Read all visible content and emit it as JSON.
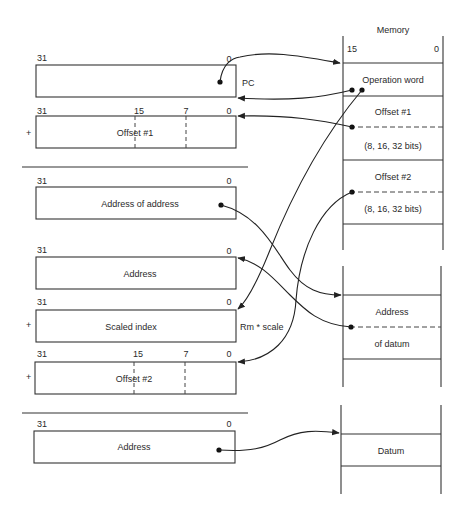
{
  "memory": {
    "title": "Memory",
    "bit_high": "15",
    "bit_low": "0",
    "cells": {
      "operation_word": "Operation word",
      "offset1": "Offset #1",
      "offset1_size": "(8, 16, 32 bits)",
      "offset2": "Offset #2",
      "offset2_size": "(8, 16, 32 bits)",
      "address_of_datum_1": "Address",
      "address_of_datum_2": "of datum",
      "datum": "Datum"
    }
  },
  "registers": {
    "pc": {
      "bit_high": "31",
      "bit_low": "0",
      "side_label": "PC"
    },
    "offset1": {
      "sign": "+",
      "bits": [
        "31",
        "15",
        "7",
        "0"
      ],
      "label": "Offset #1"
    },
    "address_of_address": {
      "bit_high": "31",
      "bit_low": "0",
      "label": "Address of address"
    },
    "address": {
      "bit_high": "31",
      "bit_low": "0",
      "label": "Address"
    },
    "scaled_index": {
      "sign": "+",
      "bit_high": "31",
      "bit_low": "0",
      "label": "Scaled index",
      "side_label": "Rm * scale"
    },
    "offset2": {
      "sign": "+",
      "bits": [
        "31",
        "15",
        "7",
        "0"
      ],
      "label": "Offset #2"
    },
    "final_address": {
      "bit_high": "31",
      "bit_low": "0",
      "label": "Address"
    }
  }
}
